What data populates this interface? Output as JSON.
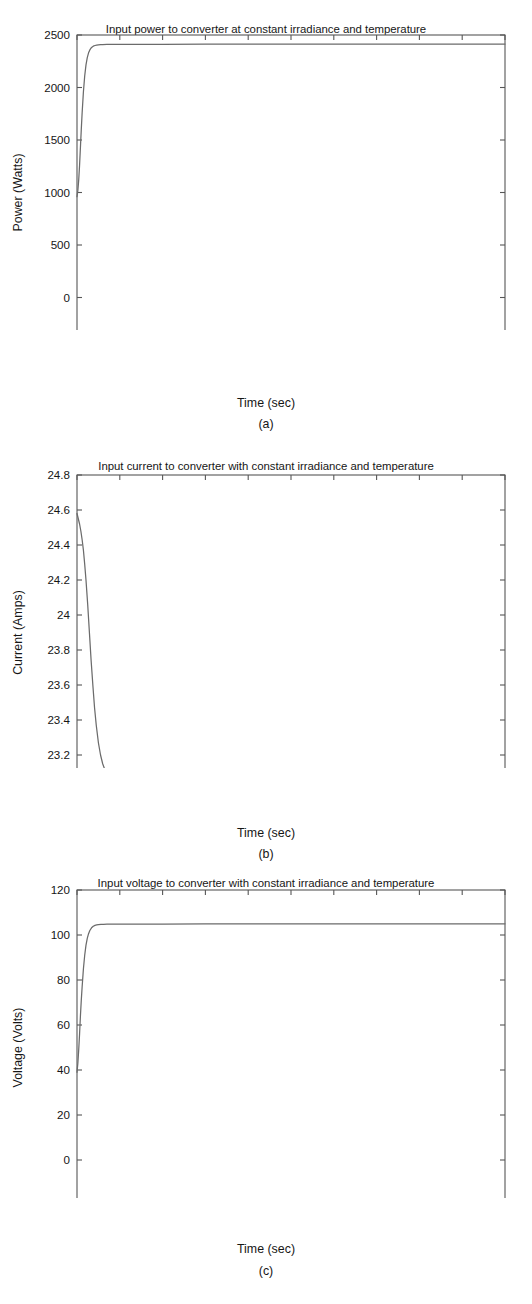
{
  "figure": {
    "panels": [
      {
        "caption": "(a)",
        "title": "Input power to converter at constant irradiance and temperature",
        "xlabel": "Time (sec)",
        "ylabel": "Power (Watts)"
      },
      {
        "caption": "(b)",
        "title": "Input current to converter with constant irradiance and temperature",
        "xlabel": "Time (sec)",
        "ylabel": "Current (Amps)"
      },
      {
        "caption": "(c)",
        "title": "Input voltage to converter with constant irradiance and temperature",
        "xlabel": "Time (sec)",
        "ylabel": "Voltage (Volts)"
      }
    ]
  },
  "style": {
    "background": "#ffffff",
    "axis_color": "#575757",
    "curve_color": "#6b6b6b",
    "text_color": "#161616"
  },
  "chart_data": [
    {
      "type": "line",
      "panel": "(a)",
      "title": "Input power to converter at constant irradiance and temperature",
      "xlabel": "Time (sec)",
      "ylabel": "Power (Watts)",
      "xlim": [
        0,
        1
      ],
      "ylim": [
        -500,
        2500
      ],
      "xticks": [
        0,
        0.1,
        0.2,
        0.3,
        0.4,
        0.5,
        0.6,
        0.7,
        0.8,
        0.9,
        1
      ],
      "xticklabels": [
        "0",
        "0.1",
        "0.2",
        "0.3",
        "0.4",
        "0.5",
        "0.6",
        "0.7",
        "0.8",
        "0.9",
        "1"
      ],
      "yticks": [
        -500,
        0,
        500,
        1000,
        1500,
        2000,
        2500
      ],
      "yticklabels": [
        "-500",
        "0",
        "500",
        "1000",
        "1500",
        "2000",
        "2500"
      ],
      "grid": false,
      "legend": "none",
      "series": [
        {
          "name": "Input power",
          "x": [
            0,
            0.002,
            0.004,
            0.006,
            0.008,
            0.01,
            0.012,
            0.015,
            0.018,
            0.021,
            0.024,
            0.027,
            0.03,
            0.034,
            0.038,
            0.042,
            0.046,
            0.05,
            0.055,
            0.06,
            0.07,
            0.08,
            0.1,
            0.15,
            0.2,
            0.3,
            0.4,
            0.5,
            0.6,
            0.7,
            0.8,
            0.9,
            1
          ],
          "y": [
            960,
            1020,
            1120,
            1260,
            1430,
            1600,
            1760,
            1960,
            2110,
            2215,
            2285,
            2330,
            2358,
            2382,
            2394,
            2400,
            2404,
            2406,
            2408,
            2409,
            2410,
            2410,
            2411,
            2411,
            2411,
            2412,
            2412,
            2412,
            2413,
            2413,
            2413,
            2414,
            2414
          ]
        }
      ]
    },
    {
      "type": "line",
      "panel": "(b)",
      "title": "Input current to converter with constant irradiance and temperature",
      "xlabel": "Time (sec)",
      "ylabel": "Current (Amps)",
      "xlim": [
        0,
        1
      ],
      "ylim": [
        23,
        24.8
      ],
      "xticks": [
        0,
        0.1,
        0.2,
        0.3,
        0.4,
        0.5,
        0.6,
        0.7,
        0.8,
        0.9,
        1
      ],
      "xticklabels": [
        "0",
        "0.1",
        "0.2",
        "0.3",
        "0.4",
        "0.5",
        "0.6",
        "0.7",
        "0.8",
        "0.9",
        "1"
      ],
      "yticks": [
        23,
        23.2,
        23.4,
        23.6,
        23.8,
        24,
        24.2,
        24.4,
        24.6,
        24.8
      ],
      "yticklabels": [
        "23",
        "23.2",
        "23.4",
        "23.6",
        "23.8",
        "24",
        "24.2",
        "24.4",
        "24.6",
        "24.8"
      ],
      "grid": false,
      "legend": "none",
      "series": [
        {
          "name": "Input current",
          "x": [
            0,
            0.003,
            0.006,
            0.009,
            0.012,
            0.015,
            0.018,
            0.021,
            0.025,
            0.029,
            0.033,
            0.037,
            0.041,
            0.045,
            0.05,
            0.055,
            0.06,
            0.066,
            0.072,
            0.08,
            0.09,
            0.1,
            0.15,
            0.2,
            0.3,
            0.4,
            0.5,
            0.6,
            0.7,
            0.8,
            0.9,
            1
          ],
          "y": [
            24.58,
            24.55,
            24.52,
            24.48,
            24.43,
            24.37,
            24.29,
            24.2,
            24.06,
            23.9,
            23.74,
            23.6,
            23.47,
            23.37,
            23.27,
            23.2,
            23.15,
            23.11,
            23.09,
            23.06,
            23.05,
            23.045,
            23.04,
            23.04,
            23.04,
            23.04,
            23.04,
            23.04,
            23.04,
            23.04,
            23.04,
            23.04
          ]
        }
      ]
    },
    {
      "type": "line",
      "panel": "(c)",
      "title": "Input voltage to converter with constant irradiance and temperature",
      "xlabel": "Time (sec)",
      "ylabel": "Voltage (Volts)",
      "xlim": [
        0,
        1
      ],
      "ylim": [
        -20,
        120
      ],
      "xticks": [
        0,
        0.1,
        0.2,
        0.3,
        0.4,
        0.5,
        0.6,
        0.7,
        0.8,
        0.9,
        1
      ],
      "xticklabels": [
        "0",
        "0.1",
        "0.2",
        "0.3",
        "0.4",
        "0.5",
        "0.6",
        "0.7",
        "0.8",
        "0.9",
        "1"
      ],
      "yticks": [
        -20,
        0,
        20,
        40,
        60,
        80,
        100,
        120
      ],
      "yticklabels": [
        "-20",
        "0",
        "20",
        "40",
        "60",
        "80",
        "100",
        "120"
      ],
      "grid": false,
      "legend": "none",
      "series": [
        {
          "name": "Input voltage",
          "x": [
            0,
            0.002,
            0.004,
            0.006,
            0.008,
            0.01,
            0.012,
            0.015,
            0.018,
            0.021,
            0.024,
            0.027,
            0.03,
            0.034,
            0.038,
            0.042,
            0.046,
            0.05,
            0.056,
            0.062,
            0.07,
            0.08,
            0.1,
            0.15,
            0.2,
            0.3,
            0.4,
            0.5,
            0.6,
            0.7,
            0.8,
            0.9,
            1
          ],
          "y": [
            39,
            43,
            49,
            56,
            64,
            71,
            77,
            85,
            91,
            95.5,
            98.5,
            100.6,
            102,
            103.2,
            103.9,
            104.3,
            104.5,
            104.6,
            104.7,
            104.75,
            104.8,
            104.82,
            104.85,
            104.87,
            104.88,
            104.9,
            104.9,
            104.92,
            104.93,
            104.95,
            104.95,
            104.97,
            104.98
          ]
        }
      ]
    }
  ]
}
